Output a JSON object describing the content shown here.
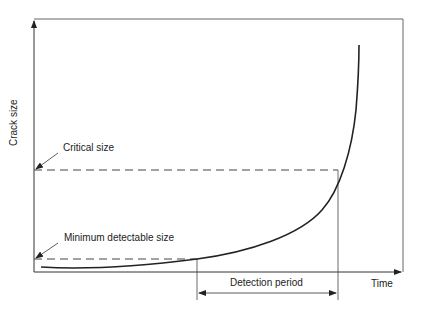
{
  "diagram": {
    "y_axis_label": "Crack size",
    "x_axis_label": "Time",
    "annotations": {
      "critical_size": "Critical size",
      "minimum_detectable_size": "Minimum detectable size",
      "detection_period": "Detection period"
    },
    "colors": {
      "line": "#222222",
      "frame": "#555555",
      "background": "#ffffff"
    }
  }
}
